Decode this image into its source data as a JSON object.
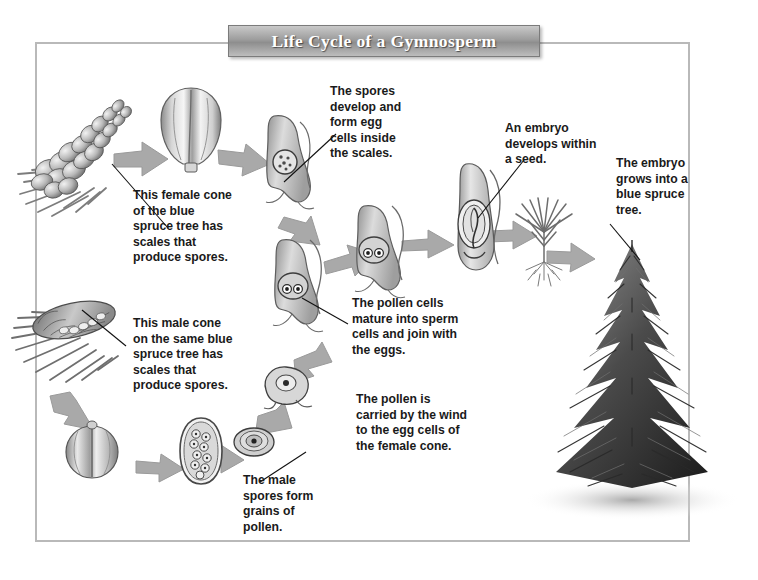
{
  "diagram": {
    "title": "Life Cycle of a Gymnosperm",
    "frame_color": "#b9b9b9",
    "banner_color": "#9d9d9d",
    "arrow_color": "#a8a8a8"
  },
  "captions": [
    {
      "id": "female-cone",
      "text": "This female cone\nof the blue\nspruce tree has\nscales that\nproduce spores."
    },
    {
      "id": "spores-egg-cells",
      "text": "The spores\ndevelop and\nform egg\ncells inside\nthe scales."
    },
    {
      "id": "embryo-seed",
      "text": "An embryo\ndevelops within\na seed."
    },
    {
      "id": "embryo-grows",
      "text": "The embryo\ngrows into a\nblue spruce\ntree."
    },
    {
      "id": "male-cone",
      "text": "This male cone\non the same blue\nspruce tree has\nscales that\nproduce spores."
    },
    {
      "id": "pollen-sperm",
      "text": "The pollen cells\nmature into sperm\ncells and join with\nthe eggs."
    },
    {
      "id": "pollen-wind",
      "text": "The pollen is\ncarried by the wind\nto the egg cells of\nthe female cone."
    },
    {
      "id": "male-spores-pollen",
      "text": "The male\nspores form\ngrains of\npollen."
    }
  ],
  "illustrations": [
    {
      "id": "female-cone-branch",
      "label": "female cone on spruce branch"
    },
    {
      "id": "female-cone-scale",
      "label": "female cone scale close-up"
    },
    {
      "id": "scale-with-ovule",
      "label": "scale containing spore / egg cell"
    },
    {
      "id": "scale-with-eggs",
      "label": "scale with egg cells"
    },
    {
      "id": "scale-fertilized",
      "label": "scale with fertilized eggs"
    },
    {
      "id": "seed-with-embryo",
      "label": "seed containing embryo"
    },
    {
      "id": "seedling",
      "label": "young spruce seedling with roots"
    },
    {
      "id": "blue-spruce-tree",
      "label": "mature blue spruce tree"
    },
    {
      "id": "male-cone-branch",
      "label": "male cone on spruce branch"
    },
    {
      "id": "male-cone-scale",
      "label": "male cone scale (pollen sac)"
    },
    {
      "id": "pollen-sac-section",
      "label": "pollen sac cross-section with spores"
    },
    {
      "id": "pollen-grain",
      "label": "single pollen grain"
    },
    {
      "id": "pollen-tube",
      "label": "germinating pollen grain"
    }
  ]
}
